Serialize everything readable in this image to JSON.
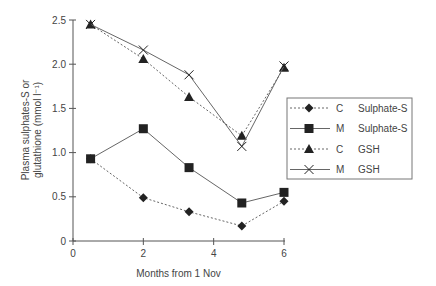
{
  "chart_data": {
    "type": "line",
    "title": "",
    "xlabel": "Months from 1 Nov",
    "ylabel_line1": "Plasma sulphates-S or",
    "ylabel_line2": "glutathione (mmol l⁻¹)",
    "xlim": [
      0,
      6
    ],
    "ylim": [
      0,
      2.5
    ],
    "x_ticks": [
      "0",
      "2",
      "4",
      "6"
    ],
    "y_ticks": [
      "0",
      "0.5",
      "1.0",
      "1.5",
      "2.0",
      "2.5"
    ],
    "x": [
      0.5,
      2,
      3.3,
      4.8,
      6
    ],
    "grid": false,
    "legend_position": "right-middle",
    "series": [
      {
        "name": "C Sulphate-S",
        "group": "C",
        "measure": "Sulphate-S",
        "marker": "diamond",
        "line": "dotted",
        "values": [
          0.93,
          0.49,
          0.33,
          0.17,
          0.45
        ]
      },
      {
        "name": "M Sulphate-S",
        "group": "M",
        "measure": "Sulphate-S",
        "marker": "square",
        "line": "solid",
        "values": [
          0.93,
          1.27,
          0.83,
          0.43,
          0.55
        ]
      },
      {
        "name": "C GSH",
        "group": "C",
        "measure": "GSH",
        "marker": "triangle",
        "line": "dotted",
        "values": [
          2.45,
          2.06,
          1.63,
          1.19,
          1.96
        ]
      },
      {
        "name": "M GSH",
        "group": "M",
        "measure": "GSH",
        "marker": "x",
        "line": "solid",
        "values": [
          2.45,
          2.16,
          1.88,
          1.07,
          1.98
        ]
      }
    ]
  },
  "colors": {
    "line": "#666666",
    "marker": "#222222",
    "axis": "#555555"
  }
}
